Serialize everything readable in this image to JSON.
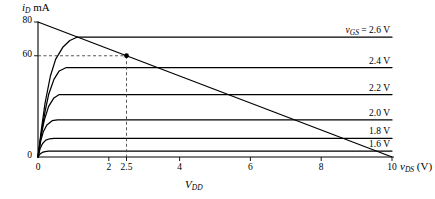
{
  "figure": {
    "background": "#ffffff",
    "line_color": "#000000",
    "dash_color": "#555555"
  },
  "axes": {
    "y_title_var": "i",
    "y_title_sub": "D",
    "y_title_unit": "mA",
    "x_title_var": "v",
    "x_title_sub": "DS",
    "x_title_unit": "(V)",
    "x_inner_label_var": "V",
    "x_inner_label_sub": "DD",
    "xlim": [
      0,
      10
    ],
    "ylim": [
      0,
      80
    ],
    "x_ticks": [
      0,
      2,
      2.5,
      4,
      6,
      8,
      10
    ],
    "x_tick_labels": [
      "0",
      "2",
      "2.5",
      "4",
      "6",
      "8",
      "10"
    ],
    "y_ticks": [
      0,
      60,
      80
    ],
    "y_tick_labels": [
      "0",
      "60",
      "80"
    ],
    "grid": false
  },
  "chart_data": {
    "type": "line",
    "title": "",
    "xlabel": "v_DS (V)",
    "ylabel": "i_D (mA)",
    "xlim": [
      0,
      10
    ],
    "ylim": [
      0,
      80
    ],
    "legend_position": "right-inline",
    "series": [
      {
        "name": "v_GS = 2.6 V",
        "label": "2.6 V",
        "saturation_current_mA": 71,
        "knee_vds": 1.1,
        "points": [
          [
            0,
            0
          ],
          [
            0.1,
            17
          ],
          [
            0.2,
            32
          ],
          [
            0.35,
            48
          ],
          [
            0.5,
            58
          ],
          [
            0.7,
            65
          ],
          [
            0.9,
            69
          ],
          [
            1.1,
            71
          ],
          [
            1.5,
            71
          ],
          [
            2.5,
            71
          ],
          [
            5,
            71
          ],
          [
            10,
            71
          ]
        ]
      },
      {
        "name": "v_GS = 2.4 V",
        "label": "2.4 V",
        "saturation_current_mA": 53,
        "knee_vds": 0.9,
        "points": [
          [
            0,
            0
          ],
          [
            0.1,
            15
          ],
          [
            0.2,
            27
          ],
          [
            0.3,
            37
          ],
          [
            0.45,
            46
          ],
          [
            0.6,
            51
          ],
          [
            0.8,
            53
          ],
          [
            0.9,
            53
          ],
          [
            1.5,
            53
          ],
          [
            5,
            53
          ],
          [
            10,
            53
          ]
        ]
      },
      {
        "name": "v_GS = 2.2 V",
        "label": "2.2 V",
        "saturation_current_mA": 37,
        "knee_vds": 0.75,
        "points": [
          [
            0,
            0
          ],
          [
            0.08,
            12
          ],
          [
            0.18,
            22
          ],
          [
            0.3,
            30
          ],
          [
            0.45,
            35
          ],
          [
            0.6,
            37
          ],
          [
            0.75,
            37
          ],
          [
            1.5,
            37
          ],
          [
            5,
            37
          ],
          [
            10,
            37
          ]
        ]
      },
      {
        "name": "v_GS = 2.0 V",
        "label": "2.0 V",
        "saturation_current_mA": 22,
        "knee_vds": 0.6,
        "points": [
          [
            0,
            0
          ],
          [
            0.07,
            9
          ],
          [
            0.15,
            15
          ],
          [
            0.25,
            19
          ],
          [
            0.4,
            21.5
          ],
          [
            0.55,
            22
          ],
          [
            0.7,
            22
          ],
          [
            1.5,
            22
          ],
          [
            5,
            22
          ],
          [
            10,
            22
          ]
        ]
      },
      {
        "name": "v_GS = 1.8 V",
        "label": "1.8 V",
        "saturation_current_mA": 11,
        "knee_vds": 0.45,
        "points": [
          [
            0,
            0
          ],
          [
            0.06,
            5
          ],
          [
            0.13,
            8
          ],
          [
            0.22,
            10
          ],
          [
            0.33,
            10.8
          ],
          [
            0.45,
            11
          ],
          [
            0.7,
            11
          ],
          [
            1.5,
            11
          ],
          [
            5,
            11
          ],
          [
            10,
            11
          ]
        ]
      },
      {
        "name": "v_GS = 1.6 V",
        "label": "1.6 V",
        "saturation_current_mA": 3.5,
        "knee_vds": 0.35,
        "points": [
          [
            0,
            0
          ],
          [
            0.05,
            1.6
          ],
          [
            0.12,
            2.7
          ],
          [
            0.2,
            3.2
          ],
          [
            0.3,
            3.45
          ],
          [
            0.4,
            3.5
          ],
          [
            0.7,
            3.5
          ],
          [
            1.5,
            3.5
          ],
          [
            5,
            3.5
          ],
          [
            10,
            3.5
          ]
        ]
      }
    ],
    "load_line": {
      "name": "load-line",
      "from": [
        0,
        80
      ],
      "to": [
        10,
        0
      ]
    },
    "operating_point": {
      "name": "Q-point",
      "vds": 2.5,
      "id_mA": 60,
      "marker": "filled-circle",
      "projection_lines": "dashed"
    },
    "curve_labels": [
      "v_GS = 2.6 V",
      "2.4 V",
      "2.2 V",
      "2.0 V",
      "1.8 V",
      "1.6 V"
    ]
  }
}
